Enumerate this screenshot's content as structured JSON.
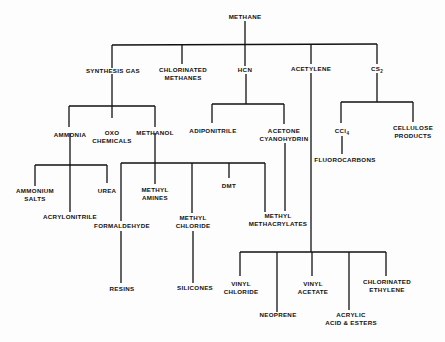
{
  "diagram": {
    "root": "METHANE",
    "level1": {
      "synthesis_gas": "SYNTHESIS GAS",
      "chlorinated_methanes_1": "CHLORINATED",
      "chlorinated_methanes_2": "METHANES",
      "hcn": "HCN",
      "acetylene": "ACETYLENE",
      "cs2": "CS",
      "cs2_sub": "2"
    },
    "synthesis_gas_children": {
      "ammonia": "AMMONIA",
      "oxo_1": "OXO",
      "oxo_2": "CHEMICALS",
      "methanol": "METHANOL"
    },
    "ammonia_children": {
      "ammonium_1": "AMMONIUM",
      "ammonium_2": "SALTS",
      "acrylonitrile": "ACRYLONITRILE",
      "urea": "UREA"
    },
    "methanol_children": {
      "formaldehyde": "FORMALDEHYDE",
      "methyl_amines_1": "METHYL",
      "methyl_amines_2": "AMINES",
      "methyl_chloride_1": "METHYL",
      "methyl_chloride_2": "CHLORIDE",
      "dmt": "DMT",
      "methyl_methacrylates_1": "METHYL",
      "methyl_methacrylates_2": "METHACRYLATES"
    },
    "formaldehyde_child": "RESINS",
    "methyl_chloride_child": "SILICONES",
    "hcn_children": {
      "adiponitrile": "ADIPONITRILE",
      "acetone_1": "ACETONE",
      "acetone_2": "CYANOHYDRIN"
    },
    "cs2_children": {
      "ccl4": "CCl",
      "ccl4_sub": "4",
      "cellulose_1": "CELLULOSE",
      "cellulose_2": "PRODUCTS"
    },
    "ccl4_child": "FLUOROCARBONS",
    "acetylene_children": {
      "vinyl_chloride_1": "VINYL",
      "vinyl_chloride_2": "CHLORIDE",
      "neoprene": "NEOPRENE",
      "vinyl_acetate_1": "VINYL",
      "vinyl_acetate_2": "ACETATE",
      "acrylic_1": "ACRYLIC",
      "acrylic_2": "ACID & ESTERS",
      "chlorinated_ethylene_1": "CHLORINATED",
      "chlorinated_ethylene_2": "ETHYLENE"
    }
  }
}
